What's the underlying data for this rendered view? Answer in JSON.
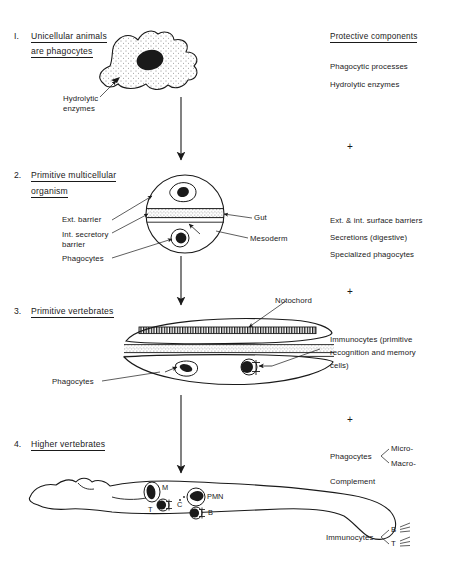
{
  "figure": {
    "ink_color": "#1a1a1a",
    "background": "#ffffff"
  },
  "stages": [
    {
      "number": "I.",
      "heading_line1": "Unicellular animals",
      "heading_line2": "are phagocytes",
      "organism": "amoeba",
      "labels": [
        {
          "name": "hydrolytic-enzymes",
          "text_line1": "Hydrolytic",
          "text_line2": "enzymes"
        }
      ]
    },
    {
      "number": "2.",
      "heading_line1": "Primitive multicellular",
      "heading_line2": "organism",
      "organism": "spherical-multicellular-organism",
      "labels": [
        {
          "name": "ext-barrier",
          "text_line1": "Ext. barrier",
          "text_line2": ""
        },
        {
          "name": "int-secretory-barrier",
          "text_line1": "Int. secretory",
          "text_line2": "barrier"
        },
        {
          "name": "phagocytes",
          "text_line1": "Phagocytes",
          "text_line2": ""
        },
        {
          "name": "gut",
          "text_line1": "Gut",
          "text_line2": ""
        },
        {
          "name": "mesoderm",
          "text_line1": "Mesoderm",
          "text_line2": ""
        }
      ]
    },
    {
      "number": "3.",
      "heading_line1": "Primitive vertebrates",
      "heading_line2": "",
      "organism": "lancelet-primitive-vertebrate",
      "labels": [
        {
          "name": "notochord",
          "text_line1": "Notochord",
          "text_line2": ""
        },
        {
          "name": "phagocytes",
          "text_line1": "Phagocytes",
          "text_line2": ""
        },
        {
          "name": "immunocytes",
          "text_line1": "Immunocytes (primitive",
          "text_line2": "recognition and memory",
          "text_line3": "cells)"
        }
      ]
    },
    {
      "number": "4.",
      "heading_line1": "Higher vertebrates",
      "heading_line2": "",
      "organism": "reclining-human-figure",
      "cell_markers": [
        {
          "name": "macrophage-marker",
          "text": "M"
        },
        {
          "name": "t-cell-marker",
          "text": "T"
        },
        {
          "name": "complement-marker",
          "text": "C"
        },
        {
          "name": "pmn-marker",
          "text": "PMN"
        },
        {
          "name": "b-cell-marker",
          "text": "B"
        }
      ]
    }
  ],
  "right_column": {
    "heading": "Protective components",
    "group1": [
      "Phagocytic processes",
      "Hydrolytic enzymes"
    ],
    "group2": [
      "Ext. & int. surface barriers",
      "Secretions (digestive)",
      "Specialized phagocytes"
    ],
    "group3": [
      "Immunocytes (primitive",
      "recognition and memory",
      "cells)"
    ],
    "group4": {
      "phagocytes_label": "Phagocytes",
      "phagocyte_types": [
        "Micro-",
        "Macro-"
      ],
      "complement_label": "Complement",
      "immunocytes_label": "Immunocytes",
      "immunocyte_types": [
        "B",
        "T"
      ]
    },
    "separators": [
      "+",
      "+",
      "+"
    ]
  }
}
